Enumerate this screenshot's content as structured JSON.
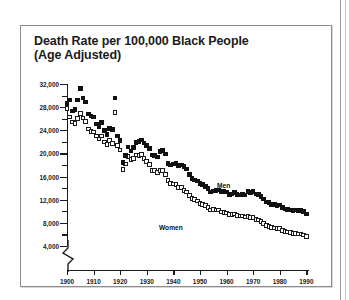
{
  "figure": {
    "title_line1": "Death Rate per 100,000 Black People",
    "title_line2": "(Age Adjusted)",
    "frame_color": "#8d8d8d",
    "background": "#ffffff"
  },
  "chart_data": {
    "type": "line",
    "title": "Death Rate per 100,000 Black People (Age Adjusted)",
    "xlabel": "",
    "ylabel": "",
    "xlim": [
      1900,
      1991
    ],
    "ylim": [
      4000,
      32000
    ],
    "ytick_step": 4000,
    "yminor_step": 2000,
    "xtick_step": 10,
    "grid": false,
    "axis_break": "y-axis broken below 4,000",
    "legend_position": "inline-annotation",
    "marker_styles": {
      "Men": "filled-black-square",
      "Women": "open-white-square"
    },
    "ytick_labels": [
      "4,000",
      "8,000",
      "12,000",
      "16,000",
      "20,000",
      "24,000",
      "28,000",
      "32,000"
    ],
    "xtick_labels": [
      "1900",
      "1910",
      "1920",
      "1930",
      "1940",
      "1950",
      "1960",
      "1970",
      "1980",
      "1990"
    ],
    "annotations": [
      {
        "text": "Men",
        "x": 1943,
        "y": 17800
      },
      {
        "text": "Women",
        "x": 1921,
        "y": 12200
      }
    ],
    "x": [
      1900,
      1901,
      1902,
      1903,
      1904,
      1905,
      1906,
      1907,
      1908,
      1909,
      1910,
      1911,
      1912,
      1913,
      1914,
      1915,
      1916,
      1917,
      1918,
      1919,
      1920,
      1921,
      1922,
      1923,
      1924,
      1925,
      1926,
      1927,
      1928,
      1929,
      1930,
      1931,
      1932,
      1933,
      1934,
      1935,
      1936,
      1937,
      1938,
      1939,
      1940,
      1941,
      1942,
      1943,
      1944,
      1945,
      1946,
      1947,
      1948,
      1949,
      1950,
      1951,
      1952,
      1953,
      1954,
      1955,
      1956,
      1957,
      1958,
      1959,
      1960,
      1961,
      1962,
      1963,
      1964,
      1965,
      1966,
      1967,
      1968,
      1969,
      1970,
      1971,
      1972,
      1973,
      1974,
      1975,
      1976,
      1977,
      1978,
      1979,
      1980,
      1981,
      1982,
      1983,
      1984,
      1985,
      1986,
      1987,
      1988,
      1989,
      1990
    ],
    "series": [
      {
        "name": "Men",
        "marker": "filled-black-square",
        "color": "#111111",
        "values": [
          28600,
          29200,
          27300,
          27600,
          29200,
          31200,
          29600,
          28900,
          26800,
          26500,
          26300,
          25100,
          24700,
          25300,
          24000,
          23300,
          24300,
          24100,
          29600,
          23000,
          22200,
          18400,
          19600,
          21100,
          20400,
          21000,
          21900,
          22100,
          22300,
          21800,
          21400,
          20900,
          19700,
          19600,
          19400,
          20300,
          20500,
          19900,
          18300,
          18000,
          18200,
          18300,
          17900,
          18000,
          17700,
          17300,
          16400,
          15700,
          15400,
          15200,
          14800,
          14600,
          14300,
          13900,
          13300,
          13500,
          13600,
          13700,
          13400,
          13400,
          13300,
          12900,
          13000,
          13200,
          12900,
          12800,
          12900,
          12800,
          13400,
          13200,
          13400,
          13000,
          12900,
          12600,
          12100,
          11600,
          11500,
          11200,
          11200,
          11000,
          11100,
          10700,
          10400,
          10300,
          10200,
          10100,
          10200,
          10100,
          10200,
          10000,
          9500
        ]
      },
      {
        "name": "Women",
        "marker": "open-white-square",
        "color": "#ffffff",
        "values": [
          27800,
          26300,
          25400,
          25200,
          26000,
          26900,
          26100,
          25500,
          24200,
          23800,
          23700,
          23000,
          22500,
          23000,
          22000,
          21500,
          22200,
          21700,
          27100,
          21400,
          20600,
          17200,
          18200,
          19500,
          18900,
          19100,
          19700,
          19600,
          19800,
          19100,
          18600,
          18100,
          17100,
          17000,
          16700,
          17000,
          17000,
          16400,
          15300,
          14800,
          14700,
          14600,
          14100,
          14100,
          13600,
          13300,
          12700,
          12200,
          12000,
          11800,
          11300,
          11200,
          11000,
          10700,
          10200,
          10300,
          10200,
          10200,
          9900,
          9800,
          9700,
          9400,
          9400,
          9500,
          9300,
          9200,
          9200,
          9000,
          9100,
          8900,
          8900,
          8600,
          8500,
          8200,
          7900,
          7500,
          7400,
          7200,
          7100,
          7000,
          7000,
          6700,
          6500,
          6400,
          6300,
          6200,
          6200,
          6100,
          6100,
          5900,
          5600
        ]
      }
    ]
  }
}
